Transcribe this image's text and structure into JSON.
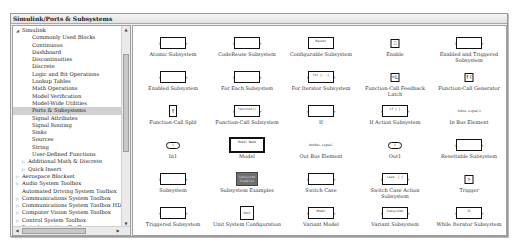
{
  "window": {
    "title": "Simulink/Ports & Subsystems"
  },
  "tree": {
    "items": [
      {
        "label": "Simulink",
        "level": 0,
        "expanded": true
      },
      {
        "label": "Commonly Used Blocks",
        "level": 2
      },
      {
        "label": "Continuous",
        "level": 2
      },
      {
        "label": "Dashboard",
        "level": 2
      },
      {
        "label": "Discontinuities",
        "level": 2
      },
      {
        "label": "Discrete",
        "level": 2
      },
      {
        "label": "Logic and Bit Operations",
        "level": 2
      },
      {
        "label": "Lookup Tables",
        "level": 2
      },
      {
        "label": "Math Operations",
        "level": 2
      },
      {
        "label": "Model Verification",
        "level": 2
      },
      {
        "label": "Model-Wide Utilities",
        "level": 2
      },
      {
        "label": "Ports & Subsystems",
        "level": 2,
        "selected": true
      },
      {
        "label": "Signal Attributes",
        "level": 2
      },
      {
        "label": "Signal Routing",
        "level": 2
      },
      {
        "label": "Sinks",
        "level": 2
      },
      {
        "label": "Sources",
        "level": 2
      },
      {
        "label": "String",
        "level": 2
      },
      {
        "label": "User-Defined Functions",
        "level": 2
      },
      {
        "label": "Additional Math & Discrete",
        "level": 1,
        "collapsed": true
      },
      {
        "label": "Quick Insert",
        "level": 1,
        "collapsed": true
      },
      {
        "label": "Aerospace Blockset",
        "level": 0,
        "collapsed": true
      },
      {
        "label": "Audio System Toolbox",
        "level": 0,
        "collapsed": true
      },
      {
        "label": "Automated Driving System Toolbox",
        "level": 0
      },
      {
        "label": "Communications System Toolbox",
        "level": 0,
        "collapsed": true
      },
      {
        "label": "Communications System Toolbox HDL S",
        "level": 0,
        "collapsed": true
      },
      {
        "label": "Computer Vision System Toolbox",
        "level": 0,
        "collapsed": true
      },
      {
        "label": "Control System Toolbox",
        "level": 0,
        "collapsed": true
      },
      {
        "label": "Data Acquisition Toolbox",
        "level": 0
      }
    ]
  },
  "blocks": [
    {
      "name": "Atomic Subsystem",
      "in": "In1",
      "out": "Out1"
    },
    {
      "name": "CodeReuse Subsystem",
      "in": "In1",
      "out": "Out1"
    },
    {
      "name": "Configurable Subsystem",
      "inner": "Master"
    },
    {
      "name": "Enable",
      "inner": "⎍"
    },
    {
      "name": "Enabled and Triggered Subsystem",
      "in": "In1",
      "out": "Out1"
    },
    {
      "name": "Enabled Subsystem",
      "in": "In1",
      "out": "Out1"
    },
    {
      "name": "For Each Subsystem",
      "in": "In1",
      "out": "Out1"
    },
    {
      "name": "For Iterator Subsystem",
      "in": "In1",
      "out": "Out1",
      "inner": "for {...}"
    },
    {
      "name": "Function-Call Feedback Latch",
      "inner": "<Lat>"
    },
    {
      "name": "Function-Call Generator",
      "inner": "f()"
    },
    {
      "name": "Function-Call Split",
      "inner": "f"
    },
    {
      "name": "Function-Call Subsystem",
      "in": "In1",
      "out": "Out1",
      "inner": "function()"
    },
    {
      "name": "If",
      "in": "u1",
      "out": "if(u1 > 0)",
      "out2": "else"
    },
    {
      "name": "If Action Subsystem",
      "in": "In1",
      "out": "Out1",
      "inner": "if { }"
    },
    {
      "name": "In Bus Element",
      "inner": "InBus.signal1"
    },
    {
      "name": "In1",
      "inner": "1"
    },
    {
      "name": "Model",
      "inner": "Model Name"
    },
    {
      "name": "Out Bus Element",
      "inner": "OutBus.signal1"
    },
    {
      "name": "Out1",
      "inner": "1"
    },
    {
      "name": "Resettable Subsystem",
      "in": "In1",
      "out": "Out1"
    },
    {
      "name": "Subsystem",
      "in": "In1",
      "out": "Out1"
    },
    {
      "name": "Subsystem Examples",
      "inner": "Subsystem Examples"
    },
    {
      "name": "Switch Case",
      "in": "u1",
      "out": "case: { 1 }",
      "out2": "default:"
    },
    {
      "name": "Switch Case Action Subsystem",
      "in": "In1",
      "out": "Out1",
      "inner": "case: { }"
    },
    {
      "name": "Trigger",
      "inner": "⚡"
    },
    {
      "name": "Triggered Subsystem",
      "in": "In1",
      "out": "Out1"
    },
    {
      "name": "Unit System Configuration",
      "inner": "Unit"
    },
    {
      "name": "Variant Model",
      "in": "In1",
      "out": "Out1",
      "inner": "Model"
    },
    {
      "name": "Variant Subsystem",
      "in": "In1",
      "out": "Out1",
      "inner": "Subsystem"
    },
    {
      "name": "While Iterator Subsystem",
      "in": "In1",
      "out": "while { ... }",
      "inner": "IC"
    }
  ],
  "colors": {
    "selection": "#d0d0d0",
    "panel": "#f0f0f0",
    "border": "#a0a0a0",
    "example_block": "#6f6f6f"
  }
}
